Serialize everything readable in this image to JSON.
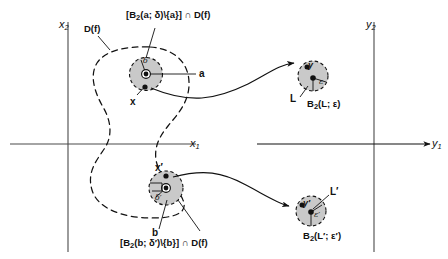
{
  "figure": {
    "title_present": false,
    "background_color": "#ffffff",
    "ink_color": "#111111",
    "disc_fill_color": "#c9c9c9",
    "axes": {
      "left_plane": {
        "vertical_axis_label": "x",
        "vertical_axis_sub": "2",
        "horizontal_axis_label": "x",
        "horizontal_axis_sub": "1"
      },
      "right_plane": {
        "vertical_axis_label": "y",
        "vertical_axis_sub": "2",
        "horizontal_axis_label": "y",
        "horizontal_axis_sub": "1"
      }
    },
    "domain_region": {
      "label": "D(f)"
    },
    "annotations": {
      "top_set_prefix": "[",
      "top_set": "B",
      "top_set_sub": "2",
      "top_set_body": "(a; δ)\\{a}] ∩ D(f)",
      "bottom_set": "B",
      "bottom_set_sub": "2",
      "bottom_set_body": "(b; δ′)\\{b}] ∩ D(f)"
    },
    "points": {
      "a": "a",
      "b": "b",
      "x": "x",
      "x_prime": "x′",
      "y": "y",
      "y_prime": "y′",
      "L": "L",
      "L_prime": "L′"
    },
    "radii": {
      "delta": "δ",
      "delta_prime": "δ′",
      "epsilon": "ε",
      "epsilon_prime": "ε′"
    },
    "balls": {
      "upper_right": {
        "name": "B",
        "sub": "2",
        "body": "(L; ε)"
      },
      "lower_right": {
        "name": "B",
        "sub": "2",
        "body": "(L′; ε′)"
      }
    }
  }
}
